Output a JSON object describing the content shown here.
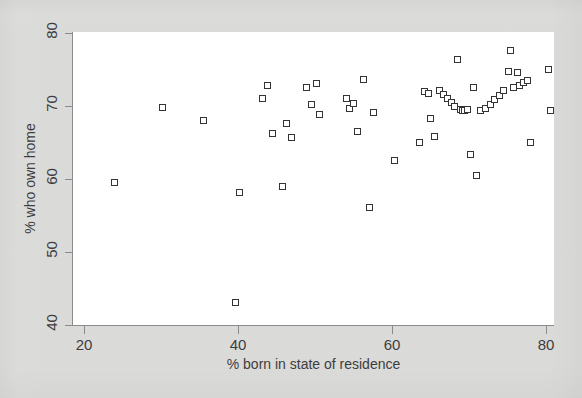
{
  "figure": {
    "background_color": "#ececeb",
    "plot_background_color": "#ffffff",
    "axis_color": "#8b8b8b",
    "marker_color": "#343434"
  },
  "chart_data": {
    "type": "scatter",
    "title": "",
    "xlabel": "% born in state of residence",
    "ylabel": "% who own home",
    "xlim": [
      20,
      82
    ],
    "ylim": [
      39,
      81
    ],
    "xticks": [
      20,
      40,
      60,
      80
    ],
    "yticks": [
      40,
      50,
      60,
      70,
      80
    ],
    "grid": false,
    "legend": null,
    "marker": "open-square",
    "n_points": 51,
    "points": [
      [
        24.0,
        59.4
      ],
      [
        30.2,
        69.7
      ],
      [
        35.6,
        68.0
      ],
      [
        39.8,
        43.0
      ],
      [
        40.2,
        58.1
      ],
      [
        43.2,
        70.9
      ],
      [
        43.9,
        72.8
      ],
      [
        44.6,
        66.2
      ],
      [
        45.9,
        58.9
      ],
      [
        46.4,
        67.5
      ],
      [
        47.0,
        65.6
      ],
      [
        48.9,
        72.4
      ],
      [
        49.6,
        70.2
      ],
      [
        50.2,
        73.0
      ],
      [
        50.6,
        68.8
      ],
      [
        54.1,
        70.9
      ],
      [
        54.6,
        69.6
      ],
      [
        55.1,
        70.3
      ],
      [
        55.6,
        66.5
      ],
      [
        56.3,
        73.5
      ],
      [
        57.2,
        56.0
      ],
      [
        57.6,
        69.1
      ],
      [
        60.4,
        62.4
      ],
      [
        63.6,
        65.0
      ],
      [
        64.3,
        71.9
      ],
      [
        64.8,
        71.7
      ],
      [
        65.1,
        68.2
      ],
      [
        65.6,
        65.8
      ],
      [
        66.2,
        72.0
      ],
      [
        66.8,
        71.5
      ],
      [
        67.3,
        71.0
      ],
      [
        67.8,
        70.4
      ],
      [
        68.2,
        69.8
      ],
      [
        68.6,
        76.3
      ],
      [
        68.9,
        69.4
      ],
      [
        69.2,
        69.3
      ],
      [
        69.5,
        69.3
      ],
      [
        69.9,
        69.5
      ],
      [
        70.3,
        63.3
      ],
      [
        70.6,
        72.4
      ],
      [
        71.0,
        60.4
      ],
      [
        71.6,
        69.3
      ],
      [
        72.2,
        69.6
      ],
      [
        72.8,
        70.2
      ],
      [
        73.4,
        70.8
      ],
      [
        74.0,
        71.4
      ],
      [
        74.6,
        72.0
      ],
      [
        75.2,
        74.6
      ],
      [
        75.4,
        77.6
      ],
      [
        75.9,
        72.5
      ],
      [
        76.4,
        74.5
      ],
      [
        76.6,
        72.8
      ],
      [
        77.2,
        73.2
      ],
      [
        77.6,
        73.4
      ],
      [
        78.1,
        65.0
      ],
      [
        80.4,
        74.9
      ],
      [
        80.6,
        69.3
      ]
    ]
  },
  "axis": {
    "x_tick_labels": [
      "20",
      "40",
      "60",
      "80"
    ],
    "y_tick_labels": [
      "40",
      "50",
      "60",
      "70",
      "80"
    ]
  }
}
